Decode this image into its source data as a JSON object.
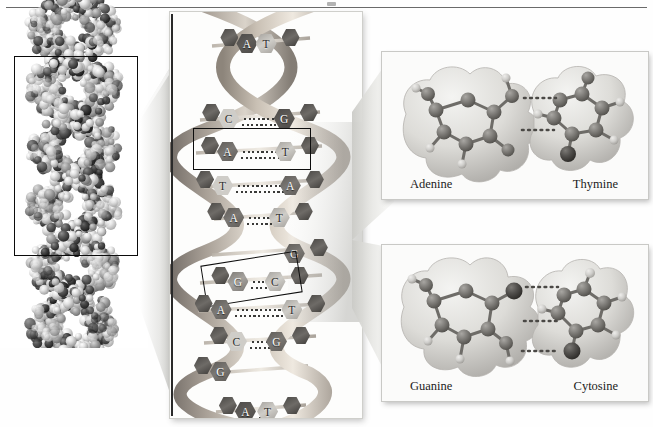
{
  "figure": {
    "colors": {
      "background": "#fefefe",
      "frame_border": "#c9c9c6",
      "rule": "#6a6a6a",
      "crop_rect": "#0b0b0b",
      "helix_ribbon_light": "#cfc6bb",
      "helix_ribbon_dark": "#9c948a",
      "base_dark": "#4c4a48",
      "base_mid": "#7b7874",
      "base_light": "#cfcdc8",
      "hbond": "#3a3a38",
      "atom_dark": "#4a4a4a",
      "atom_light": "#d9d9d9"
    }
  },
  "left_panel": {
    "name": "space-filling-dna-model",
    "caption": "",
    "crop_rect": {
      "x": 14,
      "y": 118,
      "width": 124,
      "height": 200
    }
  },
  "middle_panel": {
    "name": "dna-double-helix",
    "base_pairs": [
      {
        "left": "A",
        "right": "T",
        "y": 30,
        "highlighted": false
      },
      {
        "left": "C",
        "right": "G",
        "y": 105,
        "highlighted": false
      },
      {
        "left": "A",
        "right": "T",
        "y": 138,
        "highlighted": true
      },
      {
        "left": "T",
        "right": "A",
        "y": 172,
        "highlighted": false
      },
      {
        "left": "A",
        "right": "T",
        "y": 204,
        "highlighted": false
      },
      {
        "left": "",
        "right": "G",
        "y": 240,
        "highlighted": false
      },
      {
        "left": "G",
        "right": "C",
        "y": 268,
        "highlighted": true
      },
      {
        "left": "A",
        "right": "T",
        "y": 296,
        "highlighted": false
      },
      {
        "left": "C",
        "right": "G",
        "y": 328,
        "highlighted": false
      },
      {
        "left": "G",
        "right": "",
        "y": 358,
        "highlighted": false
      },
      {
        "left": "A",
        "right": "T",
        "y": 398,
        "highlighted": false
      }
    ],
    "highlight_boxes": 2
  },
  "at_panel": {
    "name": "adenine-thymine-base-pair",
    "left_label": "Adenine",
    "right_label": "Thymine",
    "hydrogen_bonds": 2
  },
  "gc_panel": {
    "name": "guanine-cytosine-base-pair",
    "left_label": "Guanine",
    "right_label": "Cytosine",
    "hydrogen_bonds": 3
  }
}
